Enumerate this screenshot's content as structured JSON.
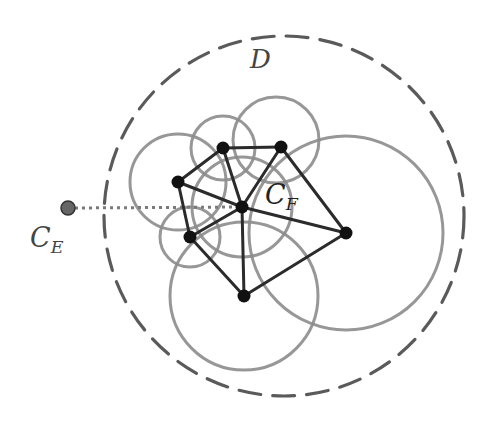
{
  "labels": {
    "region": "D",
    "external_point_main": "C",
    "external_point_sub": "E",
    "face_point_main": "C",
    "face_point_sub": "F"
  },
  "colors": {
    "background": "#ffffff",
    "dashed_boundary": "#5a5a5a",
    "circles": "#8c8c8c",
    "edges": "#2b2b2b",
    "vertices": "#111111",
    "external_point": "#666666",
    "dotted_link": "#7a7a7a",
    "label_text": "#444444"
  },
  "boundary_circle": {
    "name": "D",
    "cx": 284,
    "cy": 216,
    "r": 180,
    "dash": "22 12"
  },
  "vertices": [
    {
      "id": "v1",
      "x": 223,
      "y": 148
    },
    {
      "id": "v2",
      "x": 281,
      "y": 147
    },
    {
      "id": "v3",
      "x": 178,
      "y": 182
    },
    {
      "id": "cf",
      "x": 242,
      "y": 207
    },
    {
      "id": "v4",
      "x": 190,
      "y": 237
    },
    {
      "id": "v5",
      "x": 346,
      "y": 233
    },
    {
      "id": "v6",
      "x": 244,
      "y": 296
    }
  ],
  "edges": [
    [
      "v1",
      "v2"
    ],
    [
      "v1",
      "v3"
    ],
    [
      "v3",
      "v4"
    ],
    [
      "v4",
      "v6"
    ],
    [
      "v6",
      "v5"
    ],
    [
      "v5",
      "v2"
    ],
    [
      "v1",
      "cf"
    ],
    [
      "v2",
      "cf"
    ],
    [
      "v3",
      "cf"
    ],
    [
      "v4",
      "cf"
    ],
    [
      "v5",
      "cf"
    ],
    [
      "v6",
      "cf"
    ]
  ],
  "circles": [
    {
      "cx": 223,
      "cy": 148,
      "r": 32
    },
    {
      "cx": 276,
      "cy": 140,
      "r": 43
    },
    {
      "cx": 178,
      "cy": 182,
      "r": 48
    },
    {
      "cx": 242,
      "cy": 207,
      "r": 50
    },
    {
      "cx": 190,
      "cy": 237,
      "r": 30
    },
    {
      "cx": 244,
      "cy": 296,
      "r": 74
    },
    {
      "cx": 346,
      "cy": 233,
      "r": 97
    }
  ],
  "external_point": {
    "x": 68,
    "y": 208,
    "r": 7
  },
  "dotted_link": {
    "x1": 75,
    "y1": 208,
    "x2": 242,
    "y2": 207
  }
}
